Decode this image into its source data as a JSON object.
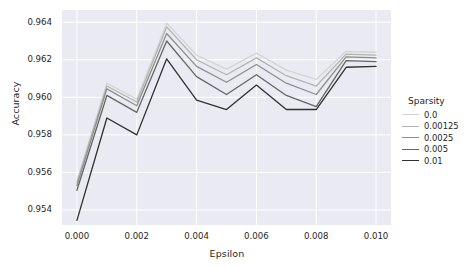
{
  "chart_data": {
    "type": "line",
    "title": "",
    "xlabel": "Epsilon",
    "ylabel": "Accuracy",
    "x": [
      0.0,
      0.001,
      0.002,
      0.003,
      0.004,
      0.005,
      0.006,
      0.007,
      0.008,
      0.009,
      0.01
    ],
    "xlim": [
      -0.0005,
      0.0105
    ],
    "ylim": [
      0.9532,
      0.96465
    ],
    "xticks": [
      0.0,
      0.002,
      0.004,
      0.006,
      0.008,
      0.01
    ],
    "xtick_labels": [
      "0.000",
      "0.002",
      "0.004",
      "0.006",
      "0.008",
      "0.010"
    ],
    "yticks": [
      0.954,
      0.956,
      0.958,
      0.96,
      0.962,
      0.964
    ],
    "ytick_labels": [
      "0.954",
      "0.956",
      "0.958",
      "0.960",
      "0.962",
      "0.964"
    ],
    "grid": true,
    "legend_title": "Sparsity",
    "legend_position": "right",
    "series": [
      {
        "name": "0.0",
        "color": "#d4d4d4",
        "width": 1.3,
        "values": [
          0.95555,
          0.96075,
          0.9599,
          0.96395,
          0.96225,
          0.9615,
          0.96235,
          0.96145,
          0.96095,
          0.96245,
          0.9624
        ]
      },
      {
        "name": "0.00125",
        "color": "#b4b4b4",
        "width": 1.3,
        "values": [
          0.95545,
          0.9606,
          0.95975,
          0.96375,
          0.962,
          0.9612,
          0.9621,
          0.96115,
          0.9606,
          0.9623,
          0.96225
        ]
      },
      {
        "name": "0.0025",
        "color": "#8e8e8e",
        "width": 1.3,
        "values": [
          0.9553,
          0.96045,
          0.95955,
          0.9634,
          0.96165,
          0.9608,
          0.96175,
          0.96075,
          0.96015,
          0.96215,
          0.9621
        ]
      },
      {
        "name": "0.005",
        "color": "#666666",
        "width": 1.3,
        "values": [
          0.95505,
          0.9601,
          0.9592,
          0.963,
          0.9611,
          0.96015,
          0.9612,
          0.9601,
          0.9595,
          0.96195,
          0.9619
        ]
      },
      {
        "name": "0.01",
        "color": "#303030",
        "width": 1.3,
        "values": [
          0.95345,
          0.9589,
          0.958,
          0.96205,
          0.95985,
          0.95935,
          0.96065,
          0.95935,
          0.95935,
          0.9616,
          0.96165
        ]
      }
    ]
  },
  "plot": {
    "background": "#eaeaf2",
    "gridline_color": "#ffffff",
    "figure_background": "#ffffff"
  }
}
